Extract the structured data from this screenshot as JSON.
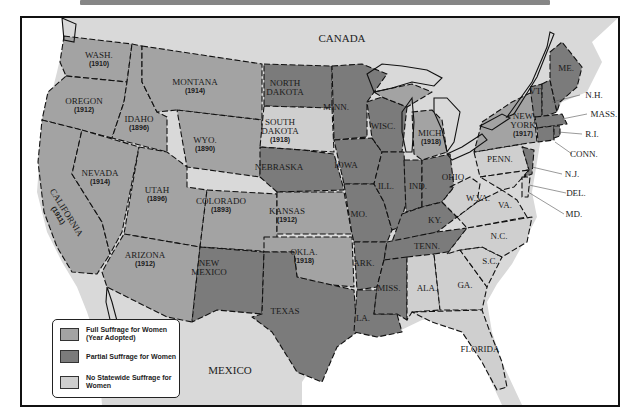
{
  "colors": {
    "full": "#a3a3a3",
    "partial": "#7b7b7b",
    "none": "#cfcfcf",
    "foreign": "#d9d9d9",
    "water": "#ffffff",
    "border": "#111111"
  },
  "countries": {
    "canada": "CANADA",
    "mexico": "MEXICO"
  },
  "states": {
    "wash": {
      "name": "WASH.",
      "year": "(1910)",
      "status": "full"
    },
    "oregon": {
      "name": "OREGON",
      "year": "(1912)",
      "status": "full"
    },
    "california": {
      "name": "CALIFORNIA",
      "year": "(1911)",
      "status": "full"
    },
    "idaho": {
      "name": "IDAHO",
      "year": "(1896)",
      "status": "full"
    },
    "nevada": {
      "name": "NEVADA",
      "year": "(1914)",
      "status": "full"
    },
    "montana": {
      "name": "MONTANA",
      "year": "(1914)",
      "status": "full"
    },
    "wyo": {
      "name": "WYO.",
      "year": "(1890)",
      "status": "full"
    },
    "utah": {
      "name": "UTAH",
      "year": "(1896)",
      "status": "full"
    },
    "colorado": {
      "name": "COLORADO",
      "year": "(1893)",
      "status": "full"
    },
    "arizona": {
      "name": "ARIZONA",
      "year": "(1912)",
      "status": "full"
    },
    "new_mexico": {
      "name_1": "NEW",
      "name_2": "MEXICO",
      "status": "partial"
    },
    "north_dakota": {
      "name_1": "NORTH",
      "name_2": "DAKOTA",
      "status": "partial"
    },
    "south_dakota": {
      "name_1": "SOUTH",
      "name_2": "DAKOTA",
      "year": "(1918)",
      "status": "full"
    },
    "nebraska": {
      "name": "NEBRASKA",
      "status": "partial"
    },
    "kansas": {
      "name": "KANSAS",
      "year": "(1912)",
      "status": "full"
    },
    "okla": {
      "name": "OKLA.",
      "year": "(1918)",
      "status": "full"
    },
    "texas": {
      "name": "TEXAS",
      "status": "partial"
    },
    "minn": {
      "name": "MINN.",
      "status": "partial"
    },
    "iowa": {
      "name": "IOWA",
      "status": "partial"
    },
    "mo": {
      "name": "MO.",
      "status": "partial"
    },
    "ark": {
      "name": "ARK.",
      "status": "partial"
    },
    "la": {
      "name": "LA.",
      "status": "partial"
    },
    "wisc": {
      "name": "WISC.",
      "status": "partial"
    },
    "ill": {
      "name": "ILL.",
      "status": "partial"
    },
    "mich": {
      "name": "MICH.",
      "year": "(1918)",
      "status": "full"
    },
    "ind": {
      "name": "IND.",
      "status": "partial"
    },
    "ohio": {
      "name": "OHIO",
      "status": "partial"
    },
    "ky": {
      "name": "KY.",
      "status": "partial"
    },
    "tenn": {
      "name": "TENN.",
      "status": "partial"
    },
    "miss": {
      "name": "MISS.",
      "status": "partial"
    },
    "ala": {
      "name": "ALA.",
      "status": "none"
    },
    "ga": {
      "name": "GA.",
      "status": "none"
    },
    "florida": {
      "name": "FLORIDA",
      "status": "none"
    },
    "sc": {
      "name": "S.C.",
      "status": "none"
    },
    "nc": {
      "name": "N.C.",
      "status": "none"
    },
    "va": {
      "name": "VA.",
      "status": "none"
    },
    "wva": {
      "name": "W.VA.",
      "status": "none"
    },
    "penn": {
      "name": "PENN.",
      "status": "none"
    },
    "new_york": {
      "name_1": "NEW",
      "name_2": "YORK",
      "year": "(1917)",
      "status": "full"
    },
    "vt": {
      "name": "VT.",
      "status": "partial"
    },
    "me": {
      "name": "ME.",
      "status": "partial"
    },
    "nh": {
      "name": "N.H.",
      "status": "partial"
    },
    "mass": {
      "name": "MASS.",
      "status": "partial"
    },
    "ri": {
      "name": "R.I.",
      "status": "partial"
    },
    "conn": {
      "name": "CONN.",
      "status": "partial"
    },
    "nj": {
      "name": "N.J.",
      "status": "partial"
    },
    "del": {
      "name": "DEL.",
      "status": "none"
    },
    "md": {
      "name": "MD.",
      "status": "none"
    }
  },
  "legend": {
    "items": [
      {
        "label": "Full Suffrage for Women (Year Adopted)",
        "status": "full"
      },
      {
        "label": "Partial Suffrage for Women",
        "status": "partial"
      },
      {
        "label": "No Statewide Suffrage for Women",
        "status": "none"
      }
    ]
  }
}
